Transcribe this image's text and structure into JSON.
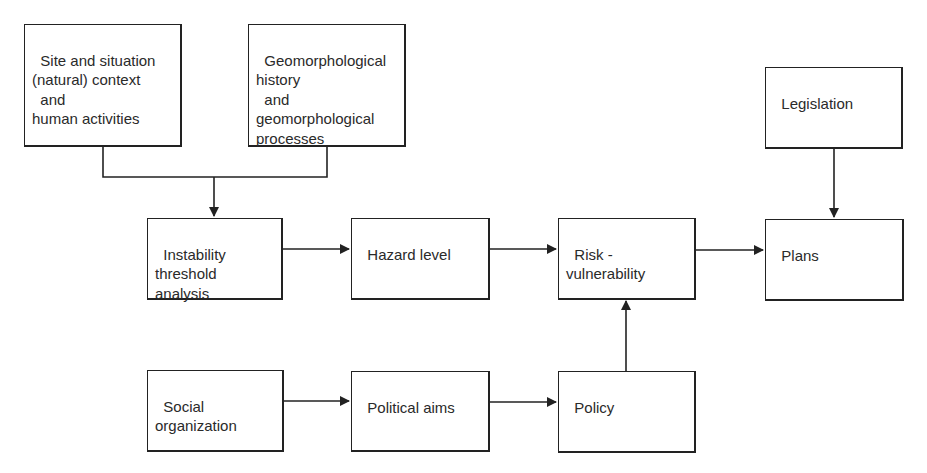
{
  "diagram": {
    "type": "flowchart",
    "nodes": {
      "site": {
        "label": "Site and situation\n(natural) context\n  and\nhuman activities"
      },
      "geomorph": {
        "label": "Geomorphological\nhistory\n  and\ngeomorphological\nprocesses"
      },
      "legislation": {
        "label": "Legislation"
      },
      "instability": {
        "label": "Instability\nthreshold\nanalysis"
      },
      "hazard": {
        "label": "Hazard level"
      },
      "risk": {
        "label": "Risk -\nvulnerability"
      },
      "plans": {
        "label": "Plans"
      },
      "social": {
        "label": "Social\norganization"
      },
      "political": {
        "label": "Political aims"
      },
      "policy": {
        "label": "Policy"
      }
    },
    "edges": [
      {
        "from": "site",
        "to": "instability"
      },
      {
        "from": "geomorph",
        "to": "instability"
      },
      {
        "from": "instability",
        "to": "hazard"
      },
      {
        "from": "hazard",
        "to": "risk"
      },
      {
        "from": "risk",
        "to": "plans"
      },
      {
        "from": "legislation",
        "to": "plans"
      },
      {
        "from": "social",
        "to": "political"
      },
      {
        "from": "political",
        "to": "policy"
      },
      {
        "from": "policy",
        "to": "risk"
      }
    ],
    "line_color": "#222222"
  }
}
